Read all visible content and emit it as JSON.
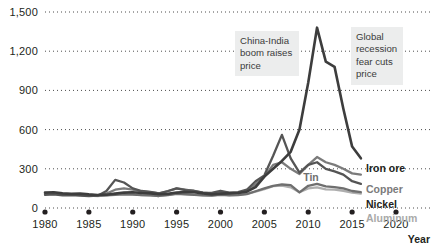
{
  "chart_data": {
    "type": "line",
    "title": "",
    "xlabel": "Year",
    "ylabel": "",
    "xlim": [
      1980,
      2020
    ],
    "ylim": [
      0,
      1500
    ],
    "grid": "horizontal-dotted",
    "legend_position": "right-inline-at-line-ends",
    "ytick_labels": [
      "0",
      "300",
      "600",
      "900",
      "1,200",
      "1,500"
    ],
    "ytick_values": [
      0,
      300,
      600,
      900,
      1200,
      1500
    ],
    "xtick_labels": [
      "1980",
      "1985",
      "1990",
      "1995",
      "2000",
      "2005",
      "2010",
      "2015",
      "2020"
    ],
    "xtick_values": [
      1980,
      1985,
      1990,
      1995,
      2000,
      2005,
      2010,
      2015,
      2020
    ],
    "x": [
      1980,
      1981,
      1982,
      1983,
      1984,
      1985,
      1986,
      1987,
      1988,
      1989,
      1990,
      1991,
      1992,
      1993,
      1994,
      1995,
      1996,
      1997,
      1998,
      1999,
      2000,
      2001,
      2002,
      2003,
      2004,
      2005,
      2006,
      2007,
      2008,
      2009,
      2010,
      2011,
      2012,
      2013,
      2014,
      2015,
      2016
    ],
    "series": [
      {
        "name": "Iron ore",
        "color": "#3d3d3d",
        "label_color": "#231f20",
        "values": [
          118,
          120,
          112,
          108,
          110,
          104,
          100,
          102,
          110,
          118,
          120,
          115,
          112,
          105,
          108,
          118,
          122,
          120,
          112,
          104,
          110,
          112,
          115,
          125,
          160,
          240,
          300,
          360,
          430,
          600,
          960,
          1380,
          1120,
          1080,
          760,
          470,
          380
        ]
      },
      {
        "name": "Copper",
        "color": "#7b7b7b",
        "label_color": "#7b7b7b",
        "values": [
          110,
          112,
          104,
          106,
          100,
          96,
          98,
          110,
          140,
          150,
          140,
          128,
          122,
          112,
          128,
          150,
          140,
          130,
          118,
          112,
          124,
          115,
          118,
          130,
          180,
          240,
          330,
          350,
          300,
          260,
          330,
          390,
          350,
          330,
          300,
          265,
          255
        ]
      },
      {
        "name": "Nickel",
        "color": "#555555",
        "label_color": "#231f20",
        "values": [
          100,
          104,
          96,
          98,
          94,
          92,
          94,
          130,
          215,
          195,
          150,
          130,
          124,
          112,
          130,
          150,
          136,
          132,
          118,
          116,
          132,
          118,
          122,
          140,
          205,
          250,
          400,
          560,
          380,
          270,
          330,
          350,
          300,
          280,
          255,
          205,
          185
        ]
      },
      {
        "name": "Tin",
        "color": "#6f6f6f",
        "label_color": "#6f6f6f",
        "values": [
          112,
          110,
          104,
          106,
          102,
          98,
          94,
          96,
          100,
          104,
          102,
          98,
          96,
          92,
          98,
          108,
          104,
          100,
          96,
          94,
          100,
          96,
          98,
          106,
          128,
          150,
          170,
          180,
          175,
          120,
          170,
          185,
          165,
          160,
          150,
          130,
          122
        ]
      },
      {
        "name": "Aluminum",
        "color": "#aeaeae",
        "label_color": "#a9a9a9",
        "values": [
          106,
          108,
          100,
          102,
          98,
          94,
          92,
          96,
          108,
          112,
          106,
          98,
          96,
          92,
          100,
          110,
          106,
          102,
          96,
          94,
          104,
          98,
          100,
          108,
          126,
          144,
          168,
          172,
          158,
          120,
          150,
          158,
          142,
          140,
          132,
          118,
          110
        ]
      }
    ],
    "annotations": [
      {
        "id": "china-india",
        "text": "China-India boom raises price"
      },
      {
        "id": "global-recession",
        "text": "Global recession fear cuts price"
      }
    ],
    "inline_labels": [
      {
        "id": "tin",
        "text": "Tin"
      }
    ],
    "end_labels": [
      {
        "id": "iron-ore",
        "text": "Iron ore"
      },
      {
        "id": "copper",
        "text": "Copper"
      },
      {
        "id": "nickel",
        "text": "Nickel"
      },
      {
        "id": "aluminum",
        "text": "Aluminum"
      }
    ]
  }
}
